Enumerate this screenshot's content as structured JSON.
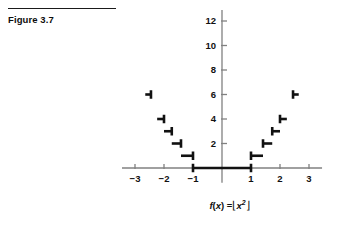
{
  "figure": {
    "label": "Figure 3.7",
    "caption_plain": "f(x) = ⌊x²⌋",
    "caption_parts": {
      "fn": "f",
      "open_paren": "(",
      "var": "x",
      "close_paren": ")",
      "equals": "=",
      "floor_left": "⌊",
      "base": "x",
      "exponent": "2",
      "floor_right": "⌋"
    }
  },
  "colors": {
    "curve": "#111111",
    "axis": "#808080",
    "text": "#111111",
    "rule": "#1a1a1a",
    "background": "#ffffff"
  },
  "chart_data": {
    "type": "line",
    "title": "",
    "subtitle": "",
    "xlabel": "",
    "ylabel": "",
    "caption": "f(x) = ⌊x²⌋",
    "function": "floor(x^2)",
    "grid": false,
    "legend": null,
    "xlim": [
      -3.45,
      3.45
    ],
    "ylim": [
      -1.2,
      13.0
    ],
    "xticks": [
      -3,
      -2,
      -1,
      1,
      2,
      3
    ],
    "xtick_labels": [
      "−3",
      "−2",
      "−1",
      "1",
      "2",
      "3"
    ],
    "yticks": [
      2,
      4,
      6,
      8,
      10,
      12
    ],
    "ytick_labels": [
      "2",
      "4",
      "6",
      "8",
      "10",
      "12"
    ],
    "step_segments": [
      {
        "y": 0,
        "x_start": -1.0,
        "x_end": 1.0,
        "left_closed": true,
        "right_closed": true
      },
      {
        "y": 1,
        "x_start": -1.4142,
        "x_end": -1.0,
        "left_closed": false,
        "right_closed": true
      },
      {
        "y": 2,
        "x_start": -1.7321,
        "x_end": -1.4142,
        "left_closed": false,
        "right_closed": true
      },
      {
        "y": 3,
        "x_start": -2.0,
        "x_end": -1.7321,
        "left_closed": false,
        "right_closed": true
      },
      {
        "y": 4,
        "x_start": -2.2361,
        "x_end": -2.0,
        "left_closed": false,
        "right_closed": true
      },
      {
        "y": 6,
        "x_start": -2.6458,
        "x_end": -2.4495,
        "left_closed": false,
        "right_closed": true
      },
      {
        "y": 1,
        "x_start": 1.0,
        "x_end": 1.4142,
        "left_closed": true,
        "right_closed": false
      },
      {
        "y": 2,
        "x_start": 1.4142,
        "x_end": 1.7321,
        "left_closed": true,
        "right_closed": false
      },
      {
        "y": 3,
        "x_start": 1.7321,
        "x_end": 2.0,
        "left_closed": true,
        "right_closed": false
      },
      {
        "y": 4,
        "x_start": 2.0,
        "x_end": 2.2361,
        "left_closed": true,
        "right_closed": false
      },
      {
        "y": 6,
        "x_start": 2.4495,
        "x_end": 2.6458,
        "left_closed": true,
        "right_closed": false
      }
    ]
  }
}
